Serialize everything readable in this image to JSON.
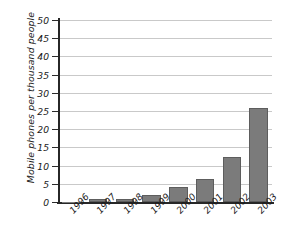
{
  "chart_data": {
    "type": "bar",
    "title": "",
    "subtitle": "",
    "xlabel": "",
    "ylabel": "Mobile phones per thousand people",
    "categories": [
      "1996",
      "1997",
      "1998",
      "1999",
      "2000",
      "2001",
      "2002",
      "2003"
    ],
    "values": [
      0.1,
      0.8,
      0.9,
      2.0,
      4.2,
      6.2,
      12.3,
      25.7
    ],
    "series": [
      {
        "name": "Mobile phones per thousand people",
        "values": [
          0.1,
          0.8,
          0.9,
          2.0,
          4.2,
          6.2,
          12.3,
          25.7
        ]
      }
    ],
    "ylim": [
      0,
      50
    ],
    "ytick_values": [
      0,
      5,
      10,
      15,
      20,
      25,
      30,
      35,
      40,
      45,
      50
    ],
    "ytick_labels": [
      "0",
      "5",
      "10",
      "15",
      "20",
      "25",
      "30",
      "35",
      "40",
      "45",
      "50"
    ],
    "ytick_step": 5,
    "grid": true,
    "grid_axis": "y",
    "legend": false,
    "legend_position": "none",
    "xtick_rotation": -47,
    "annotations": [],
    "colors": {
      "bar_fill": "#7b7b7b",
      "bar_edge": "#5d5d5d",
      "gridline": "#c9c9c9",
      "axis": "#272727",
      "text": "#1a1a1a",
      "background": "#ffffff"
    }
  }
}
